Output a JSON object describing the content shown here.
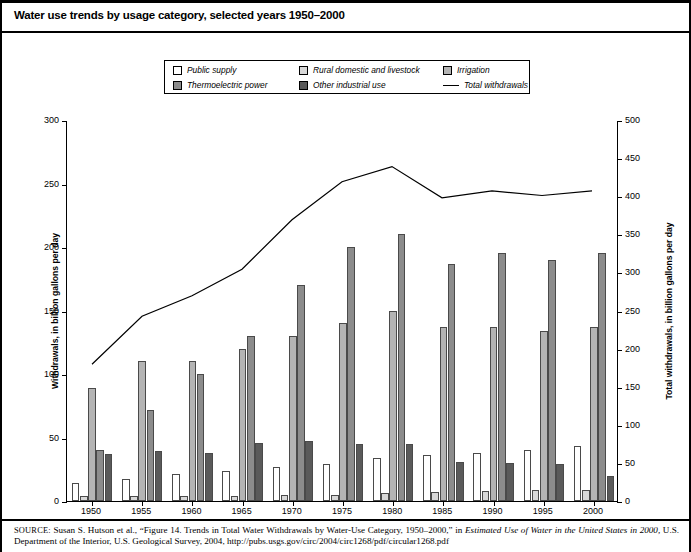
{
  "title": "Water use trends by usage category, selected years 1950–2000",
  "legend": {
    "rows": [
      [
        {
          "label": "Public supply",
          "swatch": "#ffffff",
          "type": "swatch",
          "name": "legend-swatch-public-supply"
        },
        {
          "label": "Rural domestic and livestock",
          "swatch": "#d8d8d8",
          "type": "swatch",
          "name": "legend-swatch-rural-domestic"
        },
        {
          "label": "Irrigation",
          "swatch": "#b4b4b4",
          "type": "swatch",
          "name": "legend-swatch-irrigation"
        }
      ],
      [
        {
          "label": "Thermoelectric power",
          "swatch": "#8c8c8c",
          "type": "swatch",
          "name": "legend-swatch-thermoelectric"
        },
        {
          "label": "Other industrial use",
          "swatch": "#5a5a5a",
          "type": "swatch",
          "name": "legend-swatch-other-industrial"
        },
        {
          "label": "Total withdrawals",
          "swatch": "#000000",
          "type": "line",
          "name": "legend-line-total-withdrawals"
        }
      ]
    ]
  },
  "source": {
    "prefix": "SOURCE:",
    "line1_a": " Susan S. Hutson et al., “Figure 14. Trends in Total Water Withdrawals by Water-Use Category, 1950–2000,” in ",
    "line1_italic": "Estimated Use of Water in the",
    "line2_italic": "United States in 2000,",
    "line2_b": " U.S. Department of the Interior, U.S. Geological Survey, 2004, http://pubs.usgs.gov/circ/2004/circ1268/pdf/circular1268.pdf"
  },
  "chart_data": {
    "type": "bar",
    "title": "Water use trends by usage category, selected years 1950–2000",
    "xlabel": "",
    "ylabel": "Withdrawals, in billion gallons per day",
    "y2label": "Total withdrawals, in billion gallons per day",
    "categories": [
      "1950",
      "1955",
      "1960",
      "1965",
      "1970",
      "1975",
      "1980",
      "1985",
      "1990",
      "1995",
      "2000"
    ],
    "ylim": [
      0,
      300
    ],
    "yticks": [
      0,
      50,
      100,
      150,
      200,
      250,
      300
    ],
    "y2lim": [
      0,
      500
    ],
    "y2ticks": [
      0,
      50,
      100,
      150,
      200,
      250,
      300,
      350,
      400,
      450,
      500
    ],
    "grid": false,
    "legend_position": "top-center",
    "series": [
      {
        "name": "Public supply",
        "color": "#ffffff",
        "axis": "left",
        "values": [
          14,
          17,
          21,
          24,
          27,
          29,
          34,
          36,
          38,
          40,
          43
        ]
      },
      {
        "name": "Rural domestic and livestock",
        "color": "#d8d8d8",
        "axis": "left",
        "values": [
          4,
          4,
          4,
          4,
          5,
          5,
          6,
          7,
          8,
          9,
          9
        ]
      },
      {
        "name": "Irrigation",
        "color": "#b4b4b4",
        "axis": "left",
        "values": [
          89,
          110,
          110,
          120,
          130,
          140,
          150,
          137,
          137,
          134,
          137
        ]
      },
      {
        "name": "Thermoelectric power",
        "color": "#8c8c8c",
        "axis": "left",
        "values": [
          40,
          72,
          100,
          130,
          170,
          200,
          210,
          187,
          195,
          190,
          195
        ]
      },
      {
        "name": "Other industrial use",
        "color": "#5a5a5a",
        "axis": "left",
        "values": [
          37,
          39,
          38,
          46,
          47,
          45,
          45,
          31,
          30,
          29,
          20
        ]
      }
    ],
    "line": {
      "name": "Total withdrawals",
      "color": "#000000",
      "axis": "right",
      "values": [
        180,
        243,
        270,
        305,
        370,
        420,
        440,
        399,
        408,
        402,
        408
      ]
    }
  }
}
